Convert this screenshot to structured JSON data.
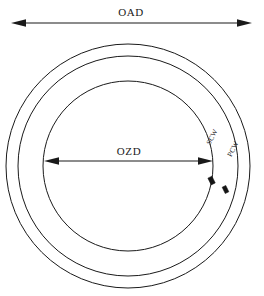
{
  "diagram": {
    "background_color": "#ffffff",
    "line_color": "#1a1a1a",
    "dimensions": [
      {
        "id": "oad",
        "label": "OAD",
        "description": "Overall assembly diameter, measured across the outermost circle",
        "orientation": "horizontal",
        "arrow_style": "double-headed",
        "y": 23,
        "x_start": 11,
        "x_end": 252,
        "label_x": 131,
        "label_y": 16
      },
      {
        "id": "ozd",
        "label": "OZD",
        "description": "Open zone diameter, measured across the innermost circle",
        "orientation": "horizontal",
        "arrow_style": "double-headed",
        "y": 161,
        "x_start": 44,
        "x_end": 213,
        "label_x": 129,
        "label_y": 155
      }
    ],
    "rings": [
      {
        "id": "outer-ring",
        "name": "outer-circle",
        "cx": 128,
        "cy": 166,
        "r": 122,
        "stroke_width": 1.0
      },
      {
        "id": "middle-ring",
        "name": "middle-circle",
        "cx": 128,
        "cy": 166,
        "r": 110,
        "stroke_width": 1.0
      },
      {
        "id": "inner-ring",
        "name": "inner-circle",
        "cx": 128,
        "cy": 166,
        "r": 85,
        "stroke_width": 1.0
      }
    ],
    "wall_labels": [
      {
        "id": "scw",
        "label": "SCW",
        "description": "Secondary containment wall thickness callout",
        "x": 214,
        "y": 138,
        "rotation": -62
      },
      {
        "id": "pcw",
        "label": "PCW",
        "description": "Primary containment wall thickness callout",
        "x": 235,
        "y": 150,
        "rotation": -62
      }
    ],
    "markers": [
      {
        "id": "scw-marker",
        "name": "scw-thickness-marker",
        "x": 211.5,
        "y": 180.5,
        "width": 4.5,
        "height": 7.5,
        "rotation": -26
      },
      {
        "id": "pcw-marker",
        "name": "pcw-thickness-marker",
        "x": 225.5,
        "y": 189.5,
        "width": 4.0,
        "height": 7.0,
        "rotation": -26
      }
    ]
  }
}
